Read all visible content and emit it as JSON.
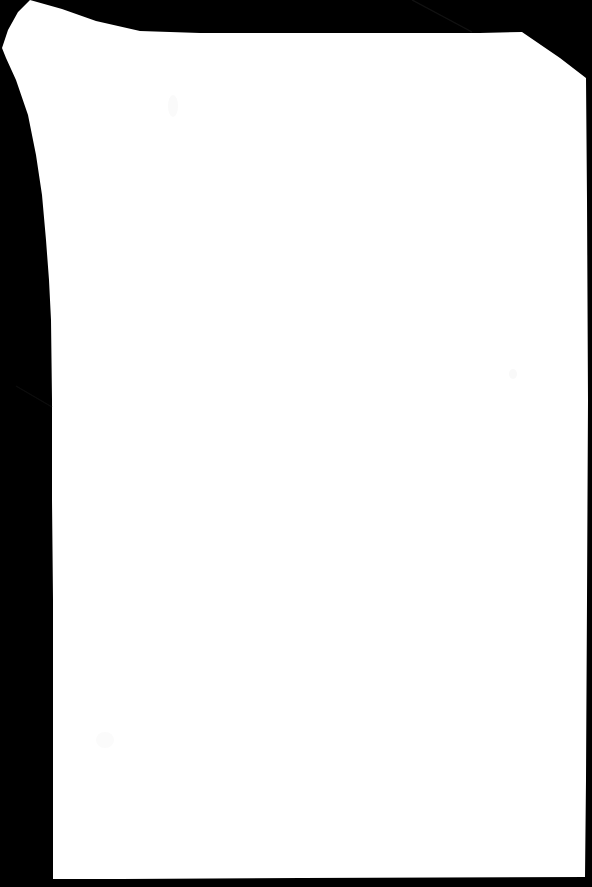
{
  "image": {
    "kind": "binary-segmentation-mask",
    "subject": "document-page",
    "width": 592,
    "height": 887,
    "background_color": "#000000",
    "foreground_color": "#FFFFFF",
    "description": "Binary mask of a scanned page: white page region on black background",
    "has_text": false,
    "has_chart": false
  },
  "mask": {
    "region_label": "page",
    "fill_color": "#FFFFFF",
    "stroke_color": "none",
    "corners": {
      "top_left_style": "curved-notch",
      "top_right_style": "chamfered",
      "bottom_left_style": "square",
      "bottom_right_style": "square"
    },
    "outline_path": "M 30,0 L 62,9 L 96,21 L 140,31 L 200,33 L 300,33 L 400,33 L 480,33 L 522,32 L 560,58 L 586,78 L 587,200 L 588,400 L 587,600 L 586,780 L 585,877 L 300,878 L 120,879 L 53,879 L 53,800 L 53,700 L 53,600 L 52,500 L 52,400 L 51,320 L 49,280 L 46,240 L 42,195 L 36,155 L 28,115 L 16,80 L 6,58 L 2,48 L 8,30 L 18,12 Z",
    "vertices_sample": [
      [
        30,
        0
      ],
      [
        140,
        31
      ],
      [
        522,
        32
      ],
      [
        586,
        78
      ],
      [
        588,
        400
      ],
      [
        585,
        877
      ],
      [
        53,
        879
      ],
      [
        52,
        400
      ],
      [
        36,
        155
      ],
      [
        2,
        48
      ]
    ]
  },
  "artifacts": {
    "diagonal_streak": {
      "name": "faint-diagonal-streak",
      "color": "#141414",
      "x1": 412,
      "y1": 0,
      "x2": 472,
      "y2": 32,
      "opacity": 0.55
    },
    "inner_diagonal_streak": {
      "name": "faint-inner-streak",
      "color": "#101010",
      "x1": 18,
      "y1": 388,
      "x2": 50,
      "y2": 406,
      "opacity": 0.5
    },
    "smudges": [
      {
        "name": "faint-smudge-upper",
        "cx": 173,
        "cy": 106,
        "rx": 5,
        "ry": 11,
        "color": "#FAFAFA"
      },
      {
        "name": "faint-smudge-lower",
        "cx": 105,
        "cy": 740,
        "rx": 9,
        "ry": 8,
        "color": "#FBFBFB"
      },
      {
        "name": "faint-smudge-mid-right",
        "cx": 513,
        "cy": 374,
        "rx": 4,
        "ry": 5,
        "color": "#F9F9F9"
      }
    ]
  }
}
